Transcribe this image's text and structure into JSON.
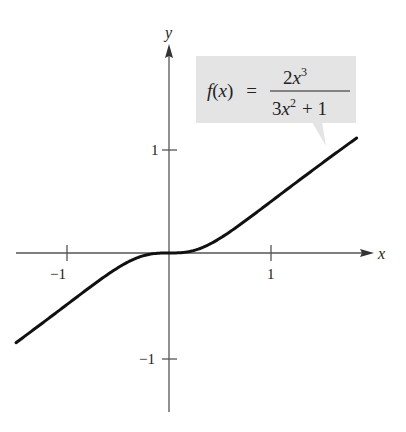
{
  "chart_data": {
    "type": "line",
    "title": "",
    "function": "f(x) = 2x^3 / (3x^2 + 1)",
    "xlabel": "x",
    "ylabel": "y",
    "xlim": [
      -1.5,
      1.84
    ],
    "ylim": [
      -1.55,
      2.0
    ],
    "grid": false,
    "legend": null,
    "x_ticks": [
      -1,
      1
    ],
    "x_tick_labels": [
      "−1",
      "1"
    ],
    "y_ticks": [
      1,
      -1
    ],
    "y_tick_labels": [
      "1",
      "−1"
    ],
    "series": [
      {
        "name": "f(x) = 2x³/(3x² + 1)",
        "x": [
          -1.5,
          -1.25,
          -1.0,
          -0.75,
          -0.5,
          -0.25,
          0,
          0.25,
          0.5,
          0.75,
          1.0,
          1.25,
          1.5,
          1.84
        ],
        "y": [
          -0.871,
          -0.693,
          -0.5,
          -0.318,
          -0.143,
          -0.026,
          0,
          0.026,
          0.143,
          0.318,
          0.5,
          0.693,
          0.871,
          1.116
        ]
      }
    ],
    "annotations": [
      {
        "text_lhs": "f(x) =",
        "numerator": "2x³",
        "denominator": "3x² + 1",
        "position": "upper right, pointer to curve near x≈1.5"
      }
    ]
  },
  "labels": {
    "x_axis": "x",
    "y_axis": "y",
    "tick_x_neg1": "−1",
    "tick_x_pos1": "1",
    "tick_y_pos1": "1",
    "tick_y_neg1": "−1"
  },
  "formula": {
    "f": "f",
    "paren_open": "(",
    "var": "x",
    "paren_close": ")",
    "equals": "=",
    "num_coef": "2",
    "num_var": "x",
    "num_exp": "3",
    "den_coef": "3",
    "den_var": "x",
    "den_exp": "2",
    "den_rest": "+ 1"
  },
  "colors": {
    "curve": "#111111",
    "axis": "#555555",
    "label_box": "#e4e4e4"
  }
}
